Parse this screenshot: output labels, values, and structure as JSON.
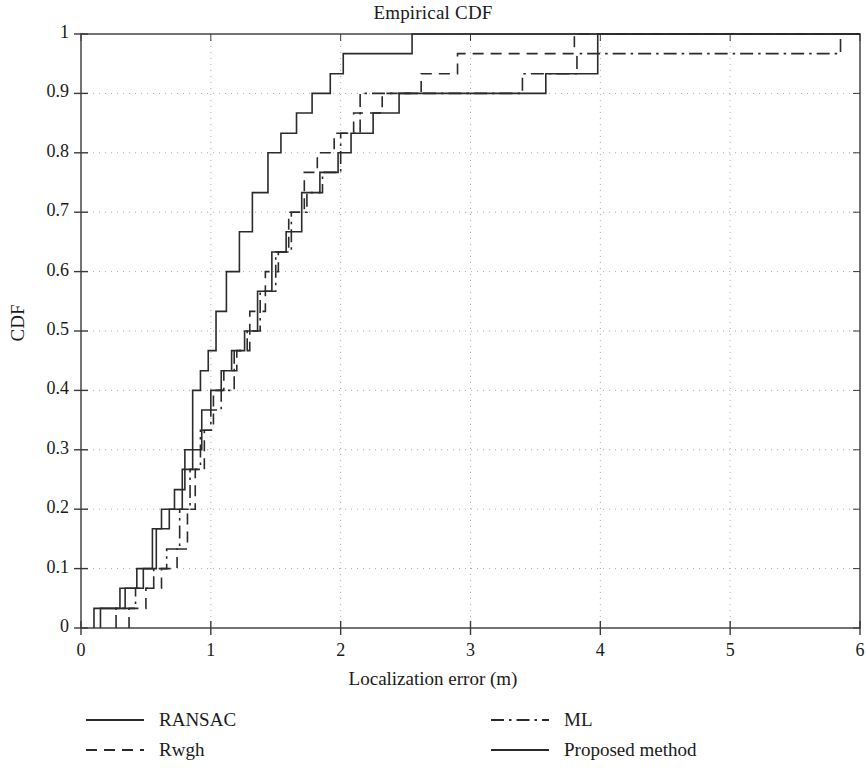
{
  "chart_data": {
    "type": "line",
    "subtype": "empirical-cdf-step",
    "title": "Empirical CDF",
    "xlabel": "Localization error (m)",
    "ylabel": "CDF",
    "xlim": [
      0,
      6
    ],
    "ylim": [
      0,
      1
    ],
    "xticks": [
      0,
      1,
      2,
      3,
      4,
      5,
      6
    ],
    "xtick_labels": [
      "0",
      "1",
      "2",
      "3",
      "4",
      "5",
      "6"
    ],
    "yticks": [
      0,
      0.1,
      0.2,
      0.3,
      0.4,
      0.5,
      0.6,
      0.7,
      0.8,
      0.9,
      1
    ],
    "ytick_labels": [
      "0",
      "0.1",
      "0.2",
      "0.3",
      "0.4",
      "0.5",
      "0.6",
      "0.7",
      "0.8",
      "0.9",
      "1"
    ],
    "grid": true,
    "grid_style": "dotted",
    "grid_color": "#aaaaaa",
    "line_color": "#2b2b2b",
    "legend_position": "below-axes",
    "series": [
      {
        "name": "RANSAC",
        "dash": "solid",
        "x": [
          0.1,
          0.1,
          0.3,
          0.3,
          0.43,
          0.43,
          0.55,
          0.55,
          0.62,
          0.62,
          0.72,
          0.72,
          0.8,
          0.8,
          0.86,
          0.86,
          0.92,
          0.92,
          0.98,
          0.98,
          1.04,
          1.04,
          1.12,
          1.12,
          1.22,
          1.22,
          1.32,
          1.32,
          1.44,
          1.44,
          1.54,
          1.54,
          1.66,
          1.66,
          1.78,
          1.78,
          1.92,
          1.92,
          2.02,
          2.02,
          2.18,
          2.18,
          2.36,
          2.36,
          2.55,
          2.55,
          6.0
        ],
        "y": [
          0.0,
          0.033,
          0.033,
          0.067,
          0.067,
          0.1,
          0.1,
          0.167,
          0.167,
          0.2,
          0.2,
          0.233,
          0.233,
          0.3,
          0.3,
          0.4,
          0.4,
          0.433,
          0.433,
          0.467,
          0.467,
          0.533,
          0.533,
          0.6,
          0.6,
          0.667,
          0.667,
          0.733,
          0.733,
          0.8,
          0.8,
          0.833,
          0.833,
          0.867,
          0.867,
          0.9,
          0.9,
          0.933,
          0.933,
          0.967,
          0.967,
          0.967,
          0.967,
          0.967,
          0.967,
          1.0,
          1.0
        ]
      },
      {
        "name": "Rwgh",
        "dash": "dashed",
        "x": [
          0.37,
          0.37,
          0.5,
          0.5,
          0.62,
          0.62,
          0.74,
          0.74,
          0.82,
          0.82,
          0.88,
          0.88,
          0.95,
          0.95,
          1.02,
          1.02,
          1.1,
          1.1,
          1.2,
          1.2,
          1.3,
          1.3,
          1.42,
          1.42,
          1.52,
          1.52,
          1.6,
          1.6,
          1.72,
          1.72,
          1.82,
          1.82,
          1.95,
          1.95,
          2.1,
          2.1,
          2.32,
          2.32,
          2.62,
          2.62,
          2.9,
          2.9,
          3.62,
          3.62,
          3.8,
          3.8,
          6.0
        ],
        "y": [
          0.0,
          0.033,
          0.033,
          0.067,
          0.067,
          0.1,
          0.1,
          0.133,
          0.133,
          0.2,
          0.2,
          0.267,
          0.267,
          0.333,
          0.333,
          0.4,
          0.4,
          0.433,
          0.433,
          0.467,
          0.467,
          0.533,
          0.533,
          0.6,
          0.6,
          0.633,
          0.633,
          0.7,
          0.7,
          0.767,
          0.767,
          0.8,
          0.8,
          0.833,
          0.833,
          0.867,
          0.867,
          0.9,
          0.9,
          0.933,
          0.933,
          0.967,
          0.967,
          0.967,
          0.967,
          1.0,
          1.0
        ]
      },
      {
        "name": "ML",
        "dash": "dashdot",
        "x": [
          0.27,
          0.27,
          0.42,
          0.42,
          0.56,
          0.56,
          0.66,
          0.66,
          0.76,
          0.76,
          0.84,
          0.84,
          0.92,
          0.92,
          1.0,
          1.0,
          1.08,
          1.08,
          1.18,
          1.18,
          1.28,
          1.28,
          1.38,
          1.38,
          1.5,
          1.5,
          1.62,
          1.62,
          1.74,
          1.74,
          1.86,
          1.86,
          2.0,
          2.0,
          2.15,
          2.15,
          2.6,
          2.6,
          3.4,
          3.4,
          3.62,
          3.62,
          3.82,
          3.82,
          5.85,
          5.85,
          6.0
        ],
        "y": [
          0.0,
          0.033,
          0.033,
          0.067,
          0.067,
          0.1,
          0.1,
          0.133,
          0.133,
          0.2,
          0.2,
          0.267,
          0.267,
          0.333,
          0.333,
          0.367,
          0.367,
          0.4,
          0.4,
          0.467,
          0.467,
          0.5,
          0.5,
          0.567,
          0.567,
          0.633,
          0.633,
          0.7,
          0.7,
          0.733,
          0.733,
          0.767,
          0.767,
          0.833,
          0.833,
          0.9,
          0.9,
          0.9,
          0.9,
          0.933,
          0.933,
          0.933,
          0.933,
          0.967,
          0.967,
          1.0,
          1.0
        ]
      },
      {
        "name": "Proposed method",
        "dash": "solid",
        "x": [
          0.15,
          0.15,
          0.34,
          0.34,
          0.48,
          0.48,
          0.58,
          0.58,
          0.68,
          0.68,
          0.78,
          0.78,
          0.86,
          0.86,
          0.93,
          0.93,
          1.0,
          1.0,
          1.08,
          1.08,
          1.16,
          1.16,
          1.26,
          1.26,
          1.36,
          1.36,
          1.47,
          1.47,
          1.58,
          1.58,
          1.7,
          1.7,
          1.84,
          1.84,
          1.98,
          1.98,
          2.08,
          2.08,
          2.25,
          2.25,
          2.45,
          2.45,
          3.45,
          3.45,
          3.58,
          3.58,
          3.98,
          3.98,
          6.0
        ],
        "y": [
          0.0,
          0.033,
          0.033,
          0.067,
          0.067,
          0.1,
          0.1,
          0.167,
          0.167,
          0.2,
          0.2,
          0.267,
          0.267,
          0.3,
          0.3,
          0.367,
          0.367,
          0.4,
          0.4,
          0.433,
          0.433,
          0.467,
          0.467,
          0.5,
          0.5,
          0.567,
          0.567,
          0.633,
          0.633,
          0.667,
          0.667,
          0.733,
          0.733,
          0.767,
          0.767,
          0.8,
          0.8,
          0.833,
          0.833,
          0.867,
          0.867,
          0.9,
          0.9,
          0.9,
          0.9,
          0.933,
          0.933,
          1.0,
          1.0
        ]
      }
    ]
  },
  "legend": {
    "items": [
      {
        "label": "RANSAC",
        "dash": "solid"
      },
      {
        "label": "Rwgh",
        "dash": "dashed"
      },
      {
        "label": "ML",
        "dash": "dashdot"
      },
      {
        "label": "Proposed method",
        "dash": "solid"
      }
    ]
  }
}
